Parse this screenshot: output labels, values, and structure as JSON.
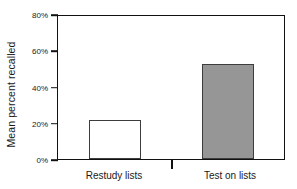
{
  "chart_data": {
    "type": "bar",
    "title": "",
    "xlabel": "",
    "ylabel": "Mean percent recalled",
    "categories": [
      "Restudy lists",
      "Test on lists"
    ],
    "values": [
      22,
      53
    ],
    "value_labels": [
      "22%",
      "53%"
    ],
    "ylim": [
      0,
      80
    ],
    "yticks": [
      0,
      20,
      40,
      60,
      80
    ],
    "ytick_labels": [
      "0%",
      "20%",
      "40%",
      "60%",
      "80%"
    ],
    "grid": false,
    "legend": false,
    "series": [
      {
        "name": "Mean percent recalled",
        "values": [
          22,
          53
        ],
        "bar_styles": [
          "open",
          "filled"
        ]
      }
    ],
    "colors": {
      "bar_open_fill": "#ffffff",
      "bar_filled_fill": "#969696",
      "bar_edge": "#3d3d3d",
      "axis": "#111111",
      "text": "#1a1a1a",
      "background": "#ffffff"
    }
  },
  "axes": {
    "y_title": "Mean percent recalled",
    "y_tick_labels": [
      "80%",
      "60%",
      "40%",
      "20%",
      "0%"
    ],
    "x_tick_labels": [
      "Restudy lists",
      "Test on lists"
    ]
  }
}
